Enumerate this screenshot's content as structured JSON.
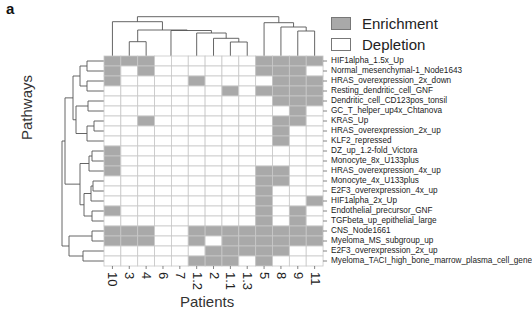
{
  "panel_label": "a",
  "legend": {
    "items": [
      {
        "label": "Enrichment",
        "color": "#a9a9a9"
      },
      {
        "label": "Depletion",
        "color": "#ffffff"
      }
    ]
  },
  "axes": {
    "xlabel": "Patients",
    "ylabel": "Pathways"
  },
  "colors": {
    "enrichment": "#a9a9a9",
    "depletion": "#ffffff",
    "grid": "#c8c8c8",
    "dendrogram": "#555555"
  },
  "chart_data": {
    "type": "heatmap",
    "title": "",
    "xlabel": "Patients",
    "ylabel": "Pathways",
    "legend": [
      "Enrichment",
      "Depletion"
    ],
    "legend_position": "top-right",
    "value_meaning": {
      "1": "Enrichment",
      "0": "Depletion"
    },
    "columns": [
      "10",
      "3",
      "4",
      "6",
      "7",
      "1.2",
      "2",
      "1.1",
      "1.3",
      "5",
      "8",
      "9",
      "11"
    ],
    "rows": [
      "HIF1alpha_1.5x_Up",
      "Normal_mesenchymal-1_Node1643",
      "HRAS_overexpression_2x_down",
      "Resting_dendritic_cell_GNF",
      "Dendritic_cell_CD123pos_tonsil",
      "GC_T_helper_up4x_Chtanova",
      "KRAS_Up",
      "HRAS_overexpression_2x_up",
      "KLF2_repressed",
      "DZ_up_1.2-fold_Victora",
      "Monocyte_8x_U133plus",
      "HRAS_overexpression_4x_up",
      "Monocyte_4x_U133plus",
      "E2F3_overexpression_4x_up",
      "HIF1alpha_2x_Up",
      "Endothelial_precursor_GNF",
      "TGFbeta_up_epithelial_large",
      "CNS_Node1661",
      "Myeloma_MS_subgroup_up",
      "E2F3_overexpression_2x_up",
      "Myeloma_TACI_high_bone_marrow_plasma_cell_gene"
    ],
    "values": [
      [
        1,
        1,
        1,
        0,
        0,
        0,
        0,
        0,
        0,
        1,
        1,
        1,
        1
      ],
      [
        1,
        0,
        1,
        0,
        0,
        0,
        0,
        0,
        0,
        1,
        1,
        1,
        0
      ],
      [
        1,
        0,
        0,
        0,
        0,
        1,
        0,
        0,
        0,
        0,
        1,
        1,
        1
      ],
      [
        0,
        0,
        0,
        0,
        0,
        0,
        0,
        1,
        0,
        1,
        1,
        1,
        1
      ],
      [
        0,
        0,
        0,
        0,
        0,
        0,
        0,
        0,
        0,
        0,
        1,
        1,
        1
      ],
      [
        0,
        0,
        0,
        0,
        0,
        0,
        0,
        0,
        0,
        0,
        0,
        1,
        0
      ],
      [
        0,
        0,
        1,
        0,
        0,
        0,
        0,
        0,
        0,
        0,
        1,
        1,
        0
      ],
      [
        0,
        0,
        0,
        0,
        0,
        0,
        0,
        0,
        0,
        0,
        1,
        0,
        0
      ],
      [
        0,
        0,
        0,
        0,
        0,
        0,
        0,
        0,
        0,
        0,
        1,
        0,
        0
      ],
      [
        1,
        0,
        0,
        0,
        0,
        0,
        0,
        0,
        0,
        0,
        0,
        0,
        0
      ],
      [
        1,
        0,
        0,
        0,
        0,
        0,
        0,
        0,
        0,
        0,
        0,
        0,
        0
      ],
      [
        1,
        0,
        0,
        0,
        0,
        0,
        0,
        0,
        0,
        1,
        1,
        0,
        0
      ],
      [
        0,
        0,
        0,
        0,
        0,
        0,
        0,
        0,
        0,
        1,
        1,
        0,
        0
      ],
      [
        0,
        0,
        0,
        0,
        0,
        0,
        0,
        0,
        0,
        1,
        0,
        0,
        0
      ],
      [
        0,
        0,
        0,
        0,
        0,
        0,
        0,
        0,
        0,
        1,
        0,
        0,
        1
      ],
      [
        1,
        0,
        0,
        0,
        0,
        0,
        0,
        0,
        0,
        1,
        0,
        1,
        0
      ],
      [
        0,
        0,
        0,
        0,
        0,
        0,
        0,
        0,
        0,
        1,
        0,
        1,
        0
      ],
      [
        1,
        1,
        1,
        0,
        0,
        1,
        1,
        1,
        1,
        1,
        1,
        1,
        1
      ],
      [
        1,
        1,
        1,
        0,
        0,
        1,
        0,
        1,
        1,
        1,
        1,
        1,
        1
      ],
      [
        0,
        0,
        0,
        0,
        0,
        0,
        1,
        1,
        1,
        1,
        1,
        0,
        0
      ],
      [
        0,
        0,
        0,
        0,
        0,
        1,
        1,
        1,
        0,
        1,
        0,
        0,
        0
      ]
    ],
    "column_dendrogram": true,
    "row_dendrogram": true
  }
}
